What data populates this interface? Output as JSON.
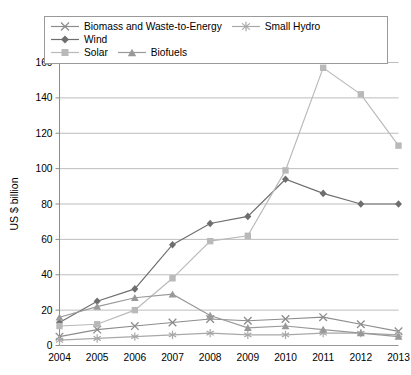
{
  "chart_data": {
    "type": "line",
    "title": "",
    "xlabel": "",
    "ylabel": "US $ billion",
    "categories": [
      "2004",
      "2005",
      "2006",
      "2007",
      "2008",
      "2009",
      "2010",
      "2011",
      "2012",
      "2013"
    ],
    "x": [
      2004,
      2005,
      2006,
      2007,
      2008,
      2009,
      2010,
      2011,
      2012,
      2013
    ],
    "ylim": [
      0,
      160
    ],
    "ytick_values": [
      0,
      20,
      40,
      60,
      80,
      100,
      120,
      140,
      160
    ],
    "ytick_labels": [
      "0",
      "20",
      "40",
      "60",
      "80",
      "100",
      "120",
      "140",
      "160"
    ],
    "grid": "horizontal",
    "legend_position": "top",
    "series": [
      {
        "name": "Biomass and Waste-to-Energy",
        "marker": "x",
        "color": "#8d8d8d",
        "values": [
          5,
          9,
          11,
          13,
          15,
          14,
          15,
          16,
          12,
          8
        ]
      },
      {
        "name": "Small Hydro",
        "marker": "asterisk",
        "color": "#a8a8a8",
        "values": [
          3,
          4,
          5,
          6,
          7,
          6,
          6,
          7,
          7,
          6
        ]
      },
      {
        "name": "Wind",
        "marker": "diamond",
        "color": "#6e6e6e",
        "values": [
          13,
          25,
          32,
          57,
          69,
          73,
          94,
          86,
          80,
          80
        ]
      },
      {
        "name": "Solar",
        "marker": "square",
        "color": "#b9b9b9",
        "values": [
          11,
          12,
          20,
          38,
          59,
          62,
          99,
          157,
          142,
          113
        ]
      },
      {
        "name": "Biofuels",
        "marker": "triangle",
        "color": "#999999",
        "values": [
          16,
          22,
          27,
          29,
          17,
          10,
          11,
          9,
          7,
          5
        ]
      }
    ]
  },
  "plot": {
    "frame_color": "#8c8c8c",
    "grid_color": "#b5b5b5",
    "background": "#ffffff"
  }
}
